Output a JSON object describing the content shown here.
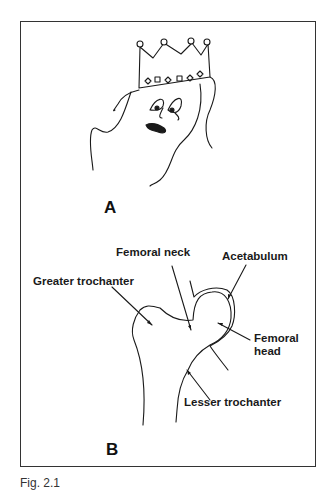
{
  "figure": {
    "caption": "Fig. 2.1",
    "panels": [
      {
        "id": "A",
        "label": "A",
        "content": "Cartoon drawing of a crowned queen figure resembling femur shape"
      },
      {
        "id": "B",
        "label": "B",
        "content": "Line drawing of proximal femur in acetabulum"
      }
    ],
    "labels": {
      "femoral_neck": "Femoral neck",
      "acetabulum": "Acetabulum",
      "greater_trochanter": "Greater trochanter",
      "femoral_head_line1": "Femoral",
      "femoral_head_line2": "head",
      "lesser_trochanter": "Lesser trochanter"
    },
    "colors": {
      "ink": "#1a1a1a",
      "frame": "#333333",
      "background": "#ffffff"
    }
  }
}
